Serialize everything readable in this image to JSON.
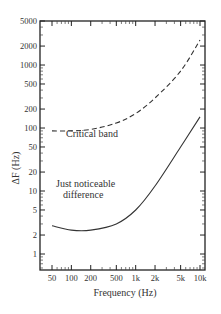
{
  "chart_data": {
    "type": "line",
    "title": "",
    "xlabel": "Frequency (Hz)",
    "ylabel": "ΔF (Hz)",
    "xscale": "log",
    "yscale": "log",
    "xlim": [
      40,
      15000
    ],
    "ylim": [
      0.5,
      5000
    ],
    "grid": false,
    "x_ticks": [
      50,
      100,
      200,
      500,
      1000,
      2000,
      5000,
      10000
    ],
    "x_tick_labels": [
      "50",
      "100",
      "200",
      "500",
      "1k",
      "2k",
      "5k",
      "10k"
    ],
    "y_ticks": [
      1,
      2,
      5,
      10,
      20,
      50,
      100,
      200,
      500,
      1000,
      2000,
      5000
    ],
    "y_tick_labels": [
      "1",
      "2",
      "5",
      "10",
      "20",
      "50",
      "100",
      "200",
      "500",
      "1000",
      "2000",
      "5000"
    ],
    "x": [
      50,
      100,
      200,
      500,
      1000,
      2000,
      5000,
      10000
    ],
    "series": [
      {
        "name": "Critical band",
        "style": "dashed",
        "values": [
          90,
          90,
          95,
          120,
          170,
          300,
          800,
          2500
        ]
      },
      {
        "name": "Just noticeable difference",
        "style": "solid",
        "values": [
          2.8,
          2.4,
          2.4,
          3,
          5,
          12,
          50,
          150
        ]
      }
    ],
    "annotations": [
      {
        "text": "Critical band",
        "near_series": "Critical band"
      },
      {
        "text": "Just noticeable",
        "near_series": "Just noticeable difference"
      },
      {
        "text": "difference",
        "near_series": "Just noticeable difference"
      }
    ],
    "legend": "none (inline annotations)"
  },
  "labels": {
    "xlabel": "Frequency (Hz)",
    "ylabel": "ΔF (Hz)",
    "annot_cb": "Critical band",
    "annot_jnd_1": "Just noticeable",
    "annot_jnd_2": "difference"
  }
}
